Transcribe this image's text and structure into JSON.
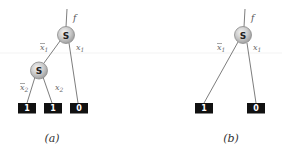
{
  "diagram": {
    "panels": [
      {
        "caption": "(a)",
        "output_label": "f",
        "nodes": [
          {
            "label": "S"
          },
          {
            "label": "S"
          }
        ],
        "leaves": [
          "1",
          "1",
          "0"
        ],
        "edge_labels": {
          "top_left": {
            "base": "x",
            "sub": "1",
            "negated": true
          },
          "top_right": {
            "base": "x",
            "sub": "1",
            "negated": false
          },
          "mid_left": {
            "base": "x",
            "sub": "2",
            "negated": true
          },
          "mid_right": {
            "base": "x",
            "sub": "2",
            "negated": false
          }
        }
      },
      {
        "caption": "(b)",
        "output_label": "f",
        "nodes": [
          {
            "label": "S"
          }
        ],
        "leaves": [
          "1",
          "0"
        ],
        "edge_labels": {
          "top_left": {
            "base": "x",
            "sub": "1",
            "negated": true
          },
          "top_right": {
            "base": "x",
            "sub": "1",
            "negated": false
          }
        }
      }
    ],
    "colors": {
      "leaf_fill": "#111111",
      "leaf_text": "#ffffff",
      "node_fill_light": "#f0f0f0",
      "node_fill_dark": "#a8a8a8",
      "edge": "#6e6e6e"
    }
  }
}
